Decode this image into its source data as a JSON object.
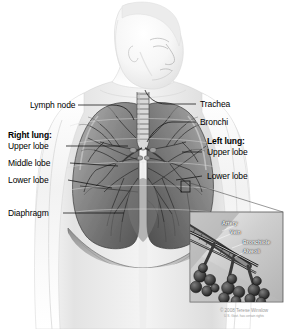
{
  "figure": {
    "background_color": "#ffffff",
    "width": 287,
    "height": 329
  },
  "labels_left": [
    {
      "id": "lymph-node",
      "text": "Lymph node",
      "bold": false
    },
    {
      "id": "right-lung",
      "text": "Right lung:",
      "bold": true
    },
    {
      "id": "upper-lobe",
      "text": "Upper lobe",
      "bold": false
    },
    {
      "id": "middle-lobe",
      "text": "Middle lobe",
      "bold": false
    },
    {
      "id": "lower-lobe",
      "text": "Lower lobe",
      "bold": false
    },
    {
      "id": "diaphragm",
      "text": "Diaphragm",
      "bold": false
    }
  ],
  "labels_right": [
    {
      "id": "trachea",
      "text": "Trachea",
      "bold": false
    },
    {
      "id": "bronchi",
      "text": "Bronchi",
      "bold": false
    },
    {
      "id": "left-lung",
      "text": "Left lung:",
      "bold": true
    },
    {
      "id": "upper-lobe",
      "text": "Upper lobe",
      "bold": false
    },
    {
      "id": "lower-lobe",
      "text": "Lower lobe",
      "bold": false
    }
  ],
  "inset": {
    "name": "alveoli-detail-inset",
    "labels": [
      {
        "id": "artery",
        "text": "Artery"
      },
      {
        "id": "vein",
        "text": "Vein"
      },
      {
        "id": "bronchiole",
        "text": "Bronchiole"
      },
      {
        "id": "alveoli",
        "text": "Alveoli"
      }
    ]
  },
  "credit": {
    "line1": "© 2008 Terese Winslow",
    "line2": "U.S. Govt. has certain rights"
  },
  "colors": {
    "ink": "#000000",
    "leader": "#1a1a1a",
    "inset_label": "#ffffff",
    "credit": "#9a9a9a",
    "background": "#ffffff"
  }
}
